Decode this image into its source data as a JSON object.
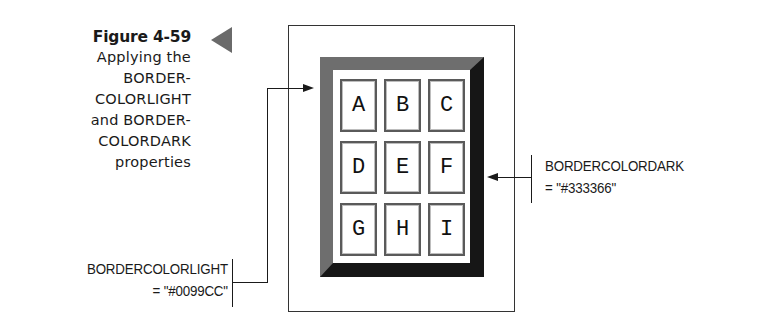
{
  "figure": {
    "number": "Figure 4-59",
    "caption_lines": [
      "Applying the",
      "BORDER-",
      "COLORLIGHT",
      "and BORDER-",
      "COLORDARK",
      "properties"
    ],
    "marker_icon": "triangle-left-icon"
  },
  "demo_table": {
    "cells": [
      "A",
      "B",
      "C",
      "D",
      "E",
      "F",
      "G",
      "H",
      "I"
    ],
    "bordercolorlight": "#0099CC",
    "bordercolordark": "#333366",
    "rendered_light_color": "#6e6e6e",
    "rendered_dark_color": "#161616"
  },
  "callouts": {
    "light": {
      "line1": "BORDERCOLORLIGHT",
      "line2": "= \"#0099CC\""
    },
    "dark": {
      "line1": "BORDERCOLORDARK",
      "line2": "= \"#333366\""
    }
  }
}
